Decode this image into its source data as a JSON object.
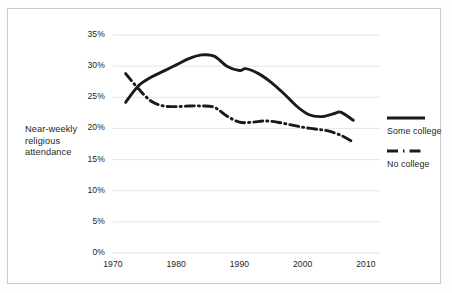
{
  "axis_title": "Near-weekly\nreligious\nattendance",
  "axis_title_lines": [
    "Near-weekly",
    "religious",
    "attendance"
  ],
  "legend": {
    "items": [
      {
        "label": "Some college",
        "style": "solid",
        "color": "#1a1a1a"
      },
      {
        "label": "No college",
        "style": "dash-dot",
        "color": "#1a1a1a"
      }
    ]
  },
  "colors": {
    "line": "#1a1a1a",
    "grid": "#e2e2e2",
    "frame": "#c9c9c9",
    "text": "#231f20",
    "background": "#ffffff"
  },
  "chart_data": {
    "type": "line",
    "title": "",
    "xlabel": "",
    "ylabel": "Near-weekly religious attendance",
    "xlim": [
      1970,
      2010
    ],
    "ylim": [
      0,
      35
    ],
    "grid": true,
    "legend_position": "right",
    "xticks": [
      1970,
      1980,
      1990,
      2000,
      2010
    ],
    "xtick_labels": [
      "1970",
      "1980",
      "1990",
      "2000",
      "2010"
    ],
    "yticks": [
      0,
      5,
      10,
      15,
      20,
      25,
      30,
      35
    ],
    "ytick_labels": [
      "0%",
      "5%",
      "10%",
      "15%",
      "20%",
      "25%",
      "30%",
      "35%"
    ],
    "series": [
      {
        "name": "Some college",
        "style": "solid",
        "x": [
          1972,
          1974,
          1976,
          1978,
          1980,
          1982,
          1984,
          1986,
          1988,
          1990,
          1991,
          1993,
          1995,
          1997,
          1999,
          2001,
          2003,
          2005,
          2006,
          2008
        ],
        "values": [
          24.2,
          26.8,
          28.2,
          29.2,
          30.2,
          31.2,
          31.8,
          31.6,
          30.0,
          29.3,
          29.6,
          28.8,
          27.4,
          25.6,
          23.6,
          22.2,
          21.9,
          22.4,
          22.6,
          21.3
        ]
      },
      {
        "name": "No college",
        "style": "dash-dot",
        "x": [
          1972,
          1974,
          1976,
          1978,
          1980,
          1982,
          1984,
          1986,
          1988,
          1990,
          1992,
          1994,
          1996,
          1998,
          2000,
          2002,
          2004,
          2006,
          2008
        ],
        "values": [
          28.8,
          26.4,
          24.4,
          23.6,
          23.5,
          23.6,
          23.6,
          23.4,
          22.0,
          21.0,
          21.0,
          21.2,
          21.0,
          20.6,
          20.2,
          19.9,
          19.6,
          18.9,
          17.8
        ]
      }
    ]
  }
}
